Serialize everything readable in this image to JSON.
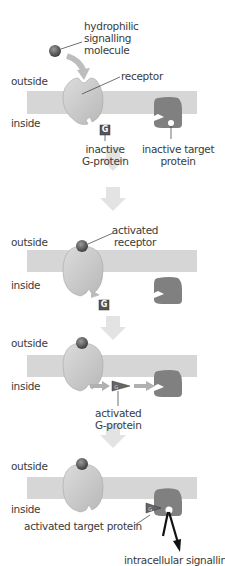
{
  "colors": {
    "membrane": "#d6d6d6",
    "receptor": "#c8c8c8",
    "receptor_edge": "#9a9a9a",
    "target_protein": "#7f7f7f",
    "signalling_molecule": "#5a5a5a",
    "g_protein": "#5f5f5f",
    "step_arrow": "#e3e3e3",
    "text": "#3b3b3b"
  },
  "panels": [
    {
      "id": 1,
      "outside_label": "outside",
      "inside_label": "inside",
      "labels": {
        "molecule": "hydrophilic\nsignalling\nmolecule",
        "receptor": "receptor",
        "g_protein": "inactive\nG-protein",
        "target": "inactive target\nprotein"
      },
      "g_glyph": "G"
    },
    {
      "id": 2,
      "outside_label": "outside",
      "inside_label": "inside",
      "labels": {
        "receptor": "activated\nreceptor"
      },
      "g_glyph": "G"
    },
    {
      "id": 3,
      "outside_label": "outside",
      "inside_label": "inside",
      "labels": {
        "g_protein": "activated\nG-protein"
      },
      "g_glyph": "G"
    },
    {
      "id": 4,
      "outside_label": "outside",
      "inside_label": "inside",
      "labels": {
        "target": "activated target protein",
        "output": "intracellular signalling"
      },
      "g_glyph": "G"
    }
  ]
}
